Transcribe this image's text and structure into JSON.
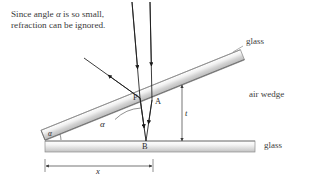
{
  "figure": {
    "annotation": {
      "line1_pre": "Since angle ",
      "line1_sym": "α",
      "line1_post": " is so small,",
      "line2": "refraction can be ignored."
    },
    "labels": {
      "glass_top": "glass",
      "glass_bottom": "glass",
      "air_wedge": "air wedge",
      "point_p": "P",
      "point_a": "A",
      "point_b": "B",
      "thickness": "t",
      "distance": "x",
      "angle_wedge": "α",
      "angle_apex": "α"
    },
    "watermark": "",
    "colors": {
      "background": "#ffffff",
      "ink": "#2b2b2b",
      "ray": "#1a1a1a",
      "glass_edge": "#8d8d8d",
      "glass_fill_light": "#fdfdfd",
      "glass_fill_mid": "#d8d8d8",
      "glass_fill_dark": "#bdbdbd",
      "dimension": "#444444",
      "text": "#333333"
    },
    "geometry": {
      "apex_x": 45,
      "apex_y": 140,
      "top_plate_angle_deg": 22,
      "bottom_plate_top_y": 141,
      "bottom_plate_bottom_y": 152,
      "point_p_x": 140,
      "point_p_y": 98,
      "point_a_x": 152,
      "point_a_y": 100,
      "point_b_x": 146,
      "point_b_y": 141,
      "thickness_line_x": 182,
      "distance_line_y": 166,
      "distance_start_x": 45,
      "distance_end_x": 153
    }
  }
}
